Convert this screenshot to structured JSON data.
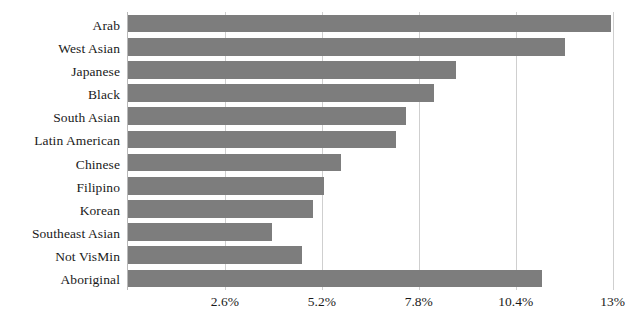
{
  "chart_data": {
    "type": "bar",
    "orientation": "horizontal",
    "title": "",
    "subtitle": "",
    "xlabel": "",
    "ylabel": "",
    "categories": [
      "Arab",
      "West Asian",
      "Japanese",
      "Black",
      "South Asian",
      "Latin American",
      "Chinese",
      "Filipino",
      "Korean",
      "Southeast Asian",
      "Not VisMin",
      "Aboriginal"
    ],
    "values": [
      12.97,
      11.71,
      8.79,
      8.21,
      7.46,
      7.19,
      5.72,
      5.27,
      4.95,
      3.85,
      4.68,
      11.11
    ],
    "value_suffix": "%",
    "xlim": [
      0,
      13.52
    ],
    "ticks": [
      2.6,
      5.2,
      7.8,
      10.4,
      13
    ],
    "tick_labels": [
      "2.6%",
      "5.2%",
      "7.8%",
      "10.4%",
      "13%"
    ],
    "grid": "vertical-only",
    "legend": "none",
    "bar_color": "#7d7d7d",
    "gridline_color": "#cfcfcf",
    "axis_color": "#b9b9b9",
    "background_color": "#ffffff",
    "text_color": "#1a1a1a"
  }
}
